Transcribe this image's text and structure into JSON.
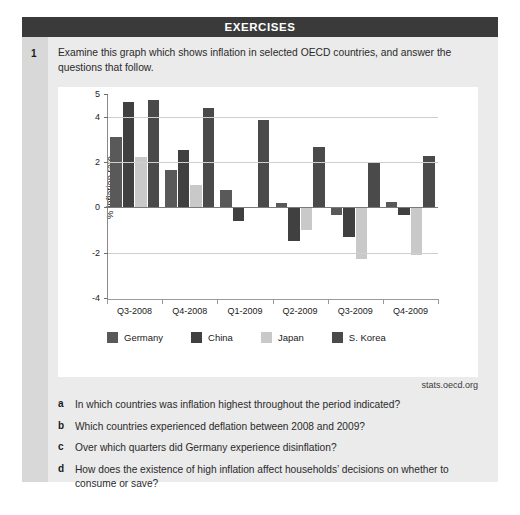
{
  "header": {
    "title": "EXERCISES"
  },
  "exercise": {
    "number": "1",
    "intro": "Examine this graph which shows inflation in selected OECD countries,  and answer the questions that follow."
  },
  "source": "stats.oecd.org",
  "colors": {
    "germany": "#595959",
    "china": "#404040",
    "japan": "#c9c9c9",
    "skorea": "#4a4a4a",
    "header_bar": "#3a3a3a",
    "card_bg": "#ebebeb",
    "rail_bg": "#d8d8d8",
    "plot_bg": "#ffffff",
    "gridline": "#cfcfcf"
  },
  "chart_data": {
    "type": "bar",
    "title": "",
    "xlabel": "",
    "ylabel": "% inflation rate",
    "ylim": [
      -4,
      5
    ],
    "yticks": [
      5,
      4,
      2,
      0,
      -2,
      -4
    ],
    "gridlines": [
      4,
      2,
      0,
      -2
    ],
    "grid": true,
    "legend_position": "bottom",
    "categories": [
      "Q3-2008",
      "Q4-2008",
      "Q1-2009",
      "Q2-2009",
      "Q3-2009",
      "Q4-2009"
    ],
    "series": [
      {
        "name": "Germany",
        "color": "#595959",
        "values": [
          3.1,
          1.65,
          0.75,
          0.2,
          -0.35,
          0.25
        ]
      },
      {
        "name": "China",
        "color": "#404040",
        "values": [
          4.65,
          2.55,
          -0.6,
          -1.5,
          -1.3,
          -0.35
        ]
      },
      {
        "name": "Japan",
        "color": "#c9c9c9",
        "values": [
          2.2,
          1.0,
          0.0,
          -1.0,
          -2.3,
          -2.1
        ]
      },
      {
        "name": "S. Korea",
        "color": "#4a4a4a",
        "values": [
          4.75,
          4.4,
          3.85,
          2.65,
          1.95,
          2.25
        ]
      }
    ]
  },
  "questions": [
    {
      "letter": "a",
      "text": "In which countries was inflation highest throughout the period indicated?"
    },
    {
      "letter": "b",
      "text": "Which countries experienced deflation between 2008 and 2009?"
    },
    {
      "letter": "c",
      "text": "Over which quarters did Germany experience disinflation?"
    },
    {
      "letter": "d",
      "text": "How does the existence of high inflation affect households’ decisions on whether to consume or save?"
    }
  ]
}
